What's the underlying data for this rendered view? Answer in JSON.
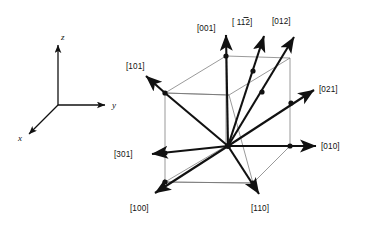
{
  "figure": {
    "background_color": "#ffffff",
    "line_color": "#111111",
    "cube_edge_color": "#6e6e6e",
    "axis_triad": {
      "name": "coordinate-axis-triad",
      "origin": [
        58,
        105
      ],
      "axes": [
        {
          "label": "z",
          "direction": "up",
          "tip": [
            58,
            42
          ]
        },
        {
          "label": "y",
          "direction": "right",
          "tip": [
            110,
            105
          ]
        },
        {
          "label": "x",
          "direction": "down-left",
          "tip": [
            26,
            137
          ]
        }
      ]
    },
    "unit_cell": {
      "name": "cubic-unit-cell",
      "origin_point": [
        228,
        146
      ],
      "corners": {
        "top_back_left": [
          226,
          56
        ],
        "top_back_right": [
          290,
          58
        ],
        "top_front_left": [
          165,
          93
        ],
        "top_front_right": [
          229,
          95
        ],
        "bottom_back_left": [
          226,
          146
        ],
        "bottom_back_right": [
          290,
          146
        ],
        "bottom_front_left": [
          165,
          182
        ],
        "bottom_front_right": [
          253,
          183
        ]
      }
    },
    "directions": [
      {
        "label": "[001]",
        "name": "direction-001",
        "tip": [
          226,
          31
        ],
        "label_pos": [
          197,
          28
        ]
      },
      {
        "label": "[ 112]",
        "name": "direction-112",
        "tip": [
          266,
          32
        ],
        "label_pos": [
          237,
          23
        ]
      },
      {
        "label": "[012]",
        "name": "direction-012",
        "tip": [
          296,
          33
        ],
        "label_pos": [
          275,
          23
        ]
      },
      {
        "label": "[021]",
        "name": "direction-021",
        "tip": [
          317,
          88
        ],
        "label_pos": [
          336,
          90
        ]
      },
      {
        "label": "[010]",
        "name": "direction-010",
        "tip": [
          320,
          146
        ],
        "label_pos": [
          338,
          149
        ]
      },
      {
        "label": "[110]",
        "name": "direction-110",
        "tip": [
          262,
          197
        ],
        "label_pos": [
          266,
          211
        ]
      },
      {
        "label": "[100]",
        "name": "direction-100",
        "tip": [
          152,
          197
        ],
        "label_pos": [
          133,
          211
        ]
      },
      {
        "label": "[301]",
        "name": "direction-301",
        "tip": [
          150,
          154
        ],
        "label_pos": [
          113,
          157
        ]
      },
      {
        "label": "[101]",
        "name": "direction-101",
        "tip": [
          143,
          73
        ],
        "label_pos": [
          129,
          66
        ]
      }
    ]
  }
}
